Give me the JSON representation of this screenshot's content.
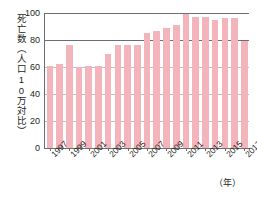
{
  "chart_data": {
    "type": "bar",
    "title": "",
    "ylabel": "死亡数（人口10万対比）",
    "xlabel": "（年）",
    "categories": [
      1997,
      1998,
      1999,
      2000,
      2001,
      2002,
      2003,
      2004,
      2005,
      2006,
      2007,
      2008,
      2009,
      2010,
      2011,
      2012,
      2013,
      2014,
      2015,
      2016,
      2017
    ],
    "values": [
      61,
      62,
      76,
      60,
      61,
      61,
      70,
      76,
      76,
      76,
      85,
      87,
      89,
      91,
      99,
      97,
      97,
      95,
      96,
      96,
      79
    ],
    "ylim": [
      0,
      100
    ],
    "yticks": [
      0,
      20,
      40,
      60,
      80,
      100
    ],
    "ytick_labels": [
      "0",
      "20",
      "40",
      "60",
      "80",
      "100"
    ],
    "xtick_labels": [
      "1997",
      "1999",
      "2001",
      "2003",
      "2005",
      "2007",
      "2009",
      "2011",
      "2013",
      "2015",
      "2017"
    ],
    "xtick_indices": [
      0,
      2,
      4,
      6,
      8,
      10,
      12,
      14,
      16,
      18,
      20
    ],
    "grid": true,
    "legend": false,
    "bar_color": "#f3b5bb",
    "axis_color": "#6d6e71",
    "text_color": "#231f20",
    "background": "#ffffff"
  }
}
